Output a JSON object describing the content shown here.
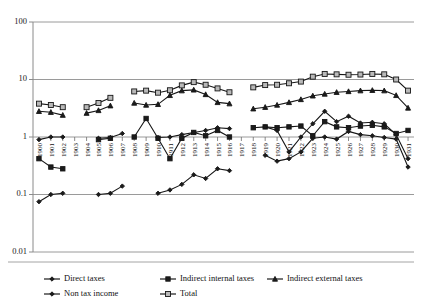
{
  "chart_data": {
    "type": "line",
    "title": "",
    "xlabel": "",
    "ylabel": "",
    "yscale": "log",
    "ylim": [
      0.01,
      100
    ],
    "yticks": [
      "0.01",
      "0.1",
      "1",
      "10",
      "100"
    ],
    "grid": true,
    "legend_position": "bottom",
    "x": [
      1900,
      1901,
      1902,
      1903,
      1904,
      1905,
      1906,
      1907,
      1908,
      1909,
      1910,
      1911,
      1912,
      1913,
      1914,
      1915,
      1916,
      1917,
      1918,
      1919,
      1920,
      1921,
      1922,
      1923,
      1924,
      1925,
      1926,
      1927,
      1928,
      1929,
      1930,
      1931
    ],
    "series": [
      {
        "name": "Direct taxes",
        "marker": "diamond",
        "values": [
          0.075,
          0.1,
          0.105,
          null,
          null,
          0.1,
          0.105,
          0.14,
          null,
          null,
          0.105,
          0.12,
          0.15,
          0.22,
          0.19,
          0.28,
          0.26,
          null,
          null,
          0.48,
          0.38,
          0.42,
          0.55,
          0.95,
          1.0,
          0.92,
          1.25,
          1.1,
          1.05,
          0.98,
          0.92,
          0.3
        ]
      },
      {
        "name": "Indirect internal taxes",
        "marker": "square",
        "values": [
          0.42,
          0.3,
          0.28,
          null,
          null,
          0.9,
          0.95,
          null,
          1.0,
          2.1,
          0.95,
          0.42,
          0.95,
          1.2,
          1.05,
          1.3,
          1.0,
          null,
          1.45,
          1.5,
          1.45,
          1.5,
          1.55,
          1.05,
          1.85,
          1.5,
          1.45,
          1.55,
          1.6,
          1.5,
          1.15,
          1.3
        ]
      },
      {
        "name": "Indirect external taxes",
        "marker": "triangle",
        "values": [
          2.8,
          2.7,
          2.4,
          null,
          2.6,
          2.9,
          3.5,
          null,
          3.9,
          3.6,
          3.7,
          5.3,
          6.4,
          6.6,
          5.5,
          4.0,
          3.8,
          null,
          3.1,
          3.3,
          3.6,
          4.0,
          4.5,
          5.2,
          5.6,
          6.0,
          6.2,
          6.4,
          6.5,
          6.4,
          5.3,
          3.2
        ]
      },
      {
        "name": "Non tax income",
        "marker": "diamond",
        "values": [
          0.9,
          1.0,
          1.0,
          null,
          null,
          0.95,
          0.98,
          1.15,
          null,
          null,
          0.98,
          1.0,
          1.1,
          1.2,
          1.3,
          1.45,
          1.4,
          null,
          null,
          1.5,
          1.3,
          0.55,
          1.0,
          1.7,
          2.8,
          1.85,
          2.3,
          1.75,
          1.8,
          1.7,
          1.1,
          0.42
        ]
      },
      {
        "name": "Total",
        "marker": "open-square",
        "values": [
          3.8,
          3.6,
          3.3,
          null,
          3.3,
          3.9,
          4.8,
          null,
          6.2,
          6.4,
          5.9,
          6.5,
          7.9,
          9.0,
          8.1,
          7.0,
          6.0,
          null,
          7.3,
          8.0,
          8.1,
          8.6,
          9.2,
          11.2,
          12.5,
          12.3,
          12.1,
          12.2,
          12.5,
          12.3,
          10.0,
          6.4
        ]
      }
    ]
  },
  "legend": {
    "items": [
      {
        "label": "Direct taxes",
        "marker": "diamond"
      },
      {
        "label": "Indirect internal taxes",
        "marker": "square"
      },
      {
        "label": "Indirect external taxes",
        "marker": "triangle"
      },
      {
        "label": "Non tax income",
        "marker": "diamond"
      },
      {
        "label": "Total",
        "marker": "open-square"
      }
    ]
  },
  "colors": {
    "line": "#161616",
    "grid": "#9a9a9a",
    "marker_fill": "#1b1b1b",
    "marker_open": "#b9b9b9",
    "background": "#ffffff"
  }
}
